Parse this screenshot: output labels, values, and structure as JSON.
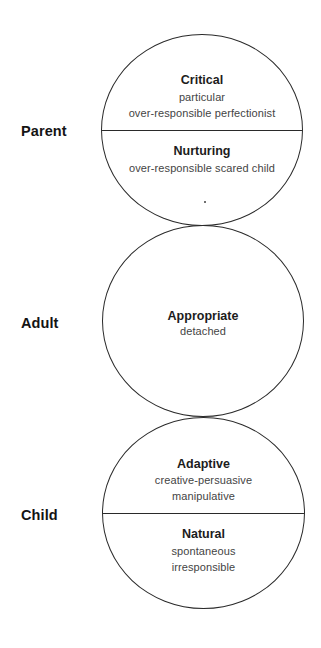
{
  "diagram": {
    "type": "ego-state-model",
    "colors": {
      "outline": "#2a2a2a",
      "label": "#141414",
      "title": "#1c1c1c",
      "description": "#444444",
      "background": "#ffffff"
    },
    "states": [
      {
        "label": "Parent",
        "sections": [
          {
            "title": "Critical",
            "lines": [
              "particular",
              "over-responsible perfectionist"
            ]
          },
          {
            "title": "Nurturing",
            "lines": [
              "over-responsible scared child"
            ]
          }
        ]
      },
      {
        "label": "Adult",
        "sections": [
          {
            "title": "Appropriate",
            "lines": [
              "detached"
            ]
          }
        ]
      },
      {
        "label": "Child",
        "sections": [
          {
            "title": "Adaptive",
            "lines": [
              "creative-persuasive",
              "manipulative"
            ]
          },
          {
            "title": "Natural",
            "lines": [
              "spontaneous",
              "irresponsible"
            ]
          }
        ]
      }
    ]
  }
}
